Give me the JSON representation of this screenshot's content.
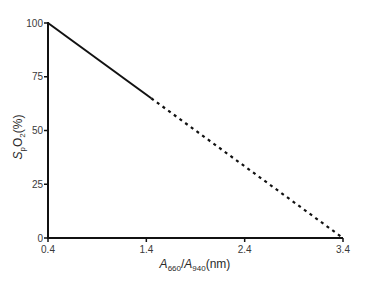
{
  "chart_data": {
    "type": "line",
    "title": "",
    "xlabel": "A660/A940 (nm)",
    "xlabel_parts": {
      "a1": "A",
      "s1": "660",
      "slash": "/",
      "a2": "A",
      "s2": "940",
      "unit": "(nm)"
    },
    "ylabel": "SpO2(%)",
    "ylabel_parts": {
      "s": "S",
      "sub": "p",
      "o": "O",
      "sub2": "2",
      "unit": "(%)"
    },
    "xlim": [
      0.4,
      3.4
    ],
    "ylim": [
      0,
      100
    ],
    "x_ticks": [
      0.4,
      1.4,
      2.4,
      3.4
    ],
    "x_tick_labels": [
      "0.4",
      "1.4",
      "2.4",
      "3.4"
    ],
    "y_ticks": [
      0,
      25,
      50,
      75,
      100
    ],
    "y_tick_labels": [
      "0",
      "25",
      "50",
      "75",
      "100"
    ],
    "grid": false,
    "legend": null,
    "series": [
      {
        "name": "measured (solid)",
        "style": "solid",
        "x": [
          0.4,
          1.45
        ],
        "y": [
          100,
          65
        ]
      },
      {
        "name": "extrapolated (dashed)",
        "style": "dotted",
        "x": [
          1.45,
          3.4
        ],
        "y": [
          65,
          0
        ]
      }
    ],
    "colors": {
      "line": "#111111",
      "axis": "#111111",
      "text": "#3a3a3a"
    }
  }
}
